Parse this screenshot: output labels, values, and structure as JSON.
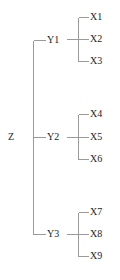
{
  "diagram": {
    "type": "hierarchical-tree",
    "orientation": "left-to-right",
    "line_color": "#9a9a9a",
    "text_color": "#242424",
    "background_color": "#ffffff",
    "levels": 3,
    "root": {
      "id": "root",
      "label": "Z",
      "x": 8,
      "y": 137
    },
    "branches": [
      {
        "id": "branch-y1",
        "label": "Y1",
        "x": 47,
        "y": 40,
        "leaves": [
          {
            "id": "leaf-x1",
            "label": "X1",
            "x": 90,
            "y": 17
          },
          {
            "id": "leaf-x2",
            "label": "X2",
            "x": 90,
            "y": 39
          },
          {
            "id": "leaf-x3",
            "label": "X3",
            "x": 90,
            "y": 61
          }
        ]
      },
      {
        "id": "branch-y2",
        "label": "Y2",
        "x": 47,
        "y": 137,
        "leaves": [
          {
            "id": "leaf-x4",
            "label": "X4",
            "x": 90,
            "y": 114
          },
          {
            "id": "leaf-x5",
            "label": "X5",
            "x": 90,
            "y": 137
          },
          {
            "id": "leaf-x6",
            "label": "X6",
            "x": 90,
            "y": 159
          }
        ]
      },
      {
        "id": "branch-y3",
        "label": "Y3",
        "x": 47,
        "y": 234,
        "leaves": [
          {
            "id": "leaf-x7",
            "label": "X7",
            "x": 90,
            "y": 212
          },
          {
            "id": "leaf-x8",
            "label": "X8",
            "x": 90,
            "y": 234
          },
          {
            "id": "leaf-x9",
            "label": "X9",
            "x": 90,
            "y": 256
          }
        ]
      }
    ]
  }
}
